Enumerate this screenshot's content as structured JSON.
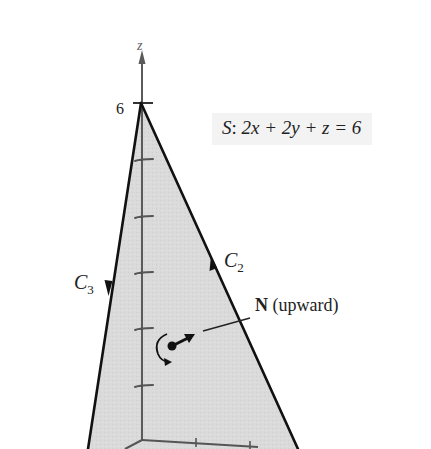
{
  "figure": {
    "surface_equation": {
      "name": "S",
      "separator": ":",
      "expression": "2x + 2y + z = 6",
      "full_text": "S: 2x + 2y + z = 6"
    },
    "axes": {
      "z_label": "z",
      "z_intercept_label": "6"
    },
    "curves": [
      {
        "name": "C",
        "subscript": "2",
        "direction": "up"
      },
      {
        "name": "C",
        "subscript": "3",
        "direction": "down"
      }
    ],
    "normal": {
      "symbol": "N",
      "note": "(upward)"
    },
    "colors": {
      "surface_fill": "#d9d9d9",
      "edge": "#111111",
      "axis": "#555555",
      "formula_bg": "#f3f3f3"
    }
  }
}
